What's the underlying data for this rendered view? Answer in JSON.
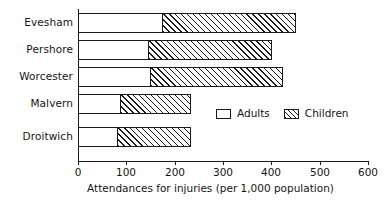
{
  "chart_data": {
    "type": "bar",
    "orientation": "horizontal",
    "stacked": true,
    "title": "",
    "xlabel": "Attendances for injuries (per 1,000 population)",
    "ylabel": "",
    "xlim": [
      0,
      600
    ],
    "xticks": [
      0,
      100,
      200,
      300,
      400,
      500,
      600
    ],
    "xtick_labels": [
      "0",
      "100",
      "200",
      "300",
      "400",
      "500",
      "600"
    ],
    "grid": false,
    "legend_position": "center-right-inside",
    "categories": [
      "Evesham",
      "Pershore",
      "Worcester",
      "Malvern",
      "Droitwich"
    ],
    "series": [
      {
        "name": "Adults",
        "fill": "white",
        "values": [
          175,
          147,
          150,
          89,
          83
        ]
      },
      {
        "name": "Children",
        "fill": "hatched",
        "values": [
          276,
          254,
          274,
          145,
          150
        ]
      }
    ],
    "totals": [
      451,
      401,
      424,
      234,
      233
    ],
    "colors": {
      "line": "#1a1a1a",
      "adults_fill": "#ffffff",
      "children_fill": "#ffffff",
      "children_hatch": "#1a1a1a",
      "background": "#ffffff"
    }
  },
  "legend": {
    "items": [
      {
        "label": "Adults"
      },
      {
        "label": "Children"
      }
    ]
  }
}
